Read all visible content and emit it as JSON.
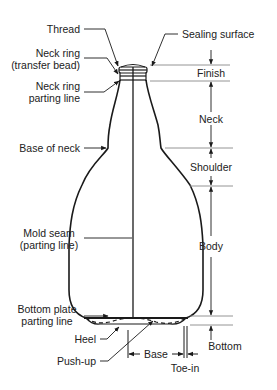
{
  "diagram": {
    "type": "labeled technical illustration",
    "left_labels": [
      {
        "id": "thread",
        "text": "Thread"
      },
      {
        "id": "neck-ring",
        "line1": "Neck ring",
        "line2": "(transfer bead)"
      },
      {
        "id": "neck-ring-parting-line",
        "line1": "Neck ring",
        "line2": "parting line"
      },
      {
        "id": "base-of-neck",
        "text": "Base of neck"
      },
      {
        "id": "mold-seam",
        "line1": "Mold seam",
        "line2": "(parting line)"
      },
      {
        "id": "bottom-plate-parting-line",
        "line1": "Bottom plate",
        "line2": "parting line"
      },
      {
        "id": "heel",
        "text": "Heel"
      },
      {
        "id": "push-up",
        "text": "Push-up"
      }
    ],
    "top_labels": [
      {
        "id": "sealing-surface",
        "text": "Sealing surface"
      }
    ],
    "right_dimensions": [
      {
        "id": "finish",
        "text": "Finish"
      },
      {
        "id": "neck",
        "text": "Neck"
      },
      {
        "id": "shoulder",
        "text": "Shoulder"
      },
      {
        "id": "body",
        "text": "Body"
      },
      {
        "id": "bottom",
        "text": "Bottom"
      }
    ],
    "bottom_dimensions": [
      {
        "id": "base",
        "text": "Base"
      },
      {
        "id": "toe-in",
        "text": "Toe-in"
      }
    ],
    "colors": {
      "line": "#1a1a1a",
      "guide": "#888888",
      "background": "#ffffff"
    }
  }
}
